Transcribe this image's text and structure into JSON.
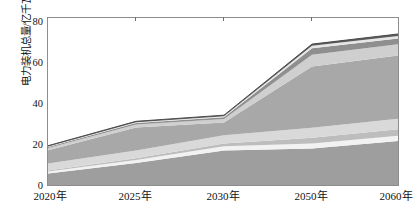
{
  "chart_data": {
    "type": "area",
    "stacked": true,
    "title": "",
    "xlabel": "",
    "ylabel": "电力装机总量/亿千瓦",
    "categories": [
      "2020年",
      "2025年",
      "2030年",
      "2050年",
      "2060年"
    ],
    "x_positions": [
      0,
      0.25,
      0.5,
      0.75,
      1.0
    ],
    "xlim_note": "categories evenly spaced on axis",
    "ylim": [
      0,
      88
    ],
    "yticks": [
      0,
      20,
      40,
      60,
      80
    ],
    "ytick_labels": [
      "0",
      "20",
      "40",
      "60",
      "80"
    ],
    "grid": false,
    "legend": "none",
    "series": [
      {
        "name": "煤电",
        "values": [
          7.0,
          12.5,
          19.0,
          20.0,
          24.0
        ],
        "color": "#9e9e9e"
      },
      {
        "name": "气电",
        "values": [
          1.1,
          1.6,
          2.2,
          2.6,
          2.8
        ],
        "color": "#f2f2f2"
      },
      {
        "name": "核电",
        "values": [
          0.5,
          0.9,
          1.4,
          3.0,
          3.4
        ],
        "color": "#bdbdbd"
      },
      {
        "name": "水电",
        "values": [
          3.7,
          4.0,
          4.4,
          5.2,
          5.4
        ],
        "color": "#d9d9d9"
      },
      {
        "name": "风光新能源",
        "values": [
          6.8,
          12.0,
          6.6,
          32.0,
          33.0
        ],
        "color": "#a8a8a8"
      },
      {
        "name": "生物质及其他",
        "values": [
          1.2,
          1.6,
          1.8,
          6.0,
          5.8
        ],
        "color": "#cfcfcf"
      },
      {
        "name": "储能",
        "values": [
          0.5,
          0.7,
          0.9,
          3.4,
          3.0
        ],
        "color": "#8f8f8f"
      },
      {
        "name": "其他",
        "values": [
          0.3,
          0.4,
          0.5,
          1.3,
          1.4
        ],
        "color": "#e6e6e6"
      },
      {
        "name": "顶层",
        "values": [
          0.4,
          0.5,
          0.6,
          0.9,
          1.0
        ],
        "color": "#5a5a5a"
      }
    ],
    "totals": [
      21.5,
      34.2,
      37.4,
      74.4,
      79.8
    ],
    "annotations": []
  },
  "axes": {
    "y_title": "电力装机总量/亿千瓦",
    "y_tick_labels": [
      "80",
      "60",
      "40",
      "20",
      "0"
    ],
    "x_tick_labels": [
      "2020年",
      "2025年",
      "2030年",
      "2050年",
      "2060年"
    ]
  },
  "colors": {
    "frame": "#8d8d8d",
    "tick": "#6e6e6e",
    "text": "#111111",
    "background": "#ffffff"
  }
}
